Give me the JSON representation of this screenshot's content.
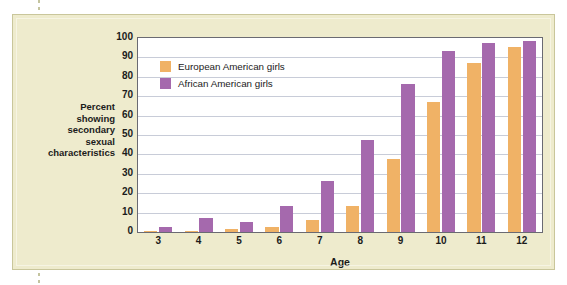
{
  "figure": {
    "background_color": "#eeebcd",
    "plot_background_color": "#ffffff",
    "axis_color": "#6a6a72",
    "grid_color": "#c8ccd8"
  },
  "y_axis_caption_lines": [
    "Percent",
    "showing",
    "secondary",
    "sexual",
    "characteristics"
  ],
  "legend": {
    "position": "top-left-inside",
    "entries": [
      {
        "label": "European American girls",
        "color": "#f0b266"
      },
      {
        "label": "African American girls",
        "color": "#a569ad"
      }
    ]
  },
  "chart_data": {
    "type": "bar",
    "title": "",
    "subtitle": "",
    "xlabel": "Age",
    "ylabel": "Percent showing secondary sexual characteristics",
    "categories": [
      "3",
      "4",
      "5",
      "6",
      "7",
      "8",
      "9",
      "10",
      "11",
      "12"
    ],
    "ylim": [
      0,
      100
    ],
    "yticks": [
      0,
      10,
      20,
      30,
      40,
      50,
      60,
      70,
      80,
      90,
      100
    ],
    "ytick_labels": [
      "0",
      "10",
      "20",
      "30",
      "40",
      "50",
      "60",
      "70",
      "80",
      "90",
      "100"
    ],
    "grid": true,
    "grid_axis": "y",
    "legend_position": "upper left",
    "series": [
      {
        "name": "European American girls",
        "color": "#f0b266",
        "values": [
          0.5,
          0.3,
          1.3,
          2.5,
          6,
          13.5,
          37.5,
          67,
          87,
          95.5
        ]
      },
      {
        "name": "African American girls",
        "color": "#a569ad",
        "values": [
          2.5,
          7,
          5,
          13.5,
          26.5,
          47.5,
          76.5,
          93.5,
          97.5,
          98.5
        ]
      }
    ]
  }
}
